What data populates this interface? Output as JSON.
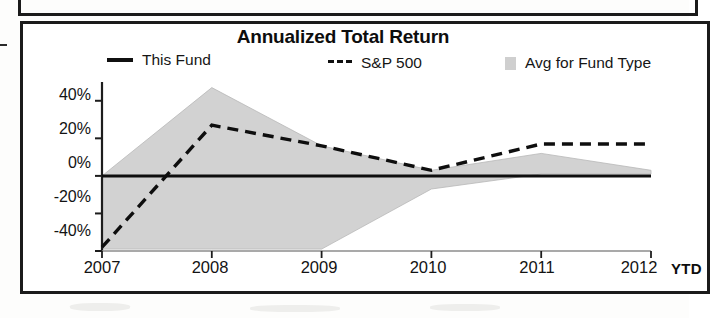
{
  "chart_data": {
    "type": "line",
    "title": "Annualized Total Return",
    "xlabel": "",
    "ylabel": "",
    "x": [
      "2007",
      "2008",
      "2009",
      "2010",
      "2011",
      "2012"
    ],
    "x_axis_note": "YTD",
    "ylim": [
      -40,
      50
    ],
    "yticks": [
      -40,
      -20,
      0,
      20,
      40
    ],
    "ytick_labels": [
      "-40%",
      "-20%",
      "0%",
      "20%",
      "40%"
    ],
    "grid": false,
    "legend_position": "top",
    "series": [
      {
        "name": "This Fund",
        "style": "solid",
        "color": "#101010",
        "values": [
          0,
          0,
          0,
          0,
          0,
          0
        ]
      },
      {
        "name": "S&P 500",
        "style": "dashed",
        "color": "#101010",
        "values": [
          -38,
          27,
          16,
          3,
          17,
          17
        ]
      },
      {
        "name": "Avg for Fund Type",
        "style": "band",
        "color": "#d2d2d2",
        "band_upper": [
          0,
          47,
          16,
          3,
          12,
          3
        ],
        "band_lower": [
          -39,
          -39,
          -39,
          -7,
          1,
          1
        ]
      }
    ]
  },
  "chart": {
    "title": "Annualized Total Return",
    "legend": [
      {
        "label": "This Fund",
        "marker": "solid-line-swatch"
      },
      {
        "label": "S&P 500",
        "marker": "dashed-line-swatch"
      },
      {
        "label": "Avg for Fund Type",
        "marker": "gray-box-swatch"
      }
    ],
    "y_axis": {
      "labels": [
        "40%",
        "20%",
        "0%",
        "-20%",
        "-40%"
      ]
    },
    "x_axis": {
      "labels": [
        "2007",
        "2008",
        "2009",
        "2010",
        "2011",
        "2012"
      ],
      "suffix": "YTD"
    }
  }
}
